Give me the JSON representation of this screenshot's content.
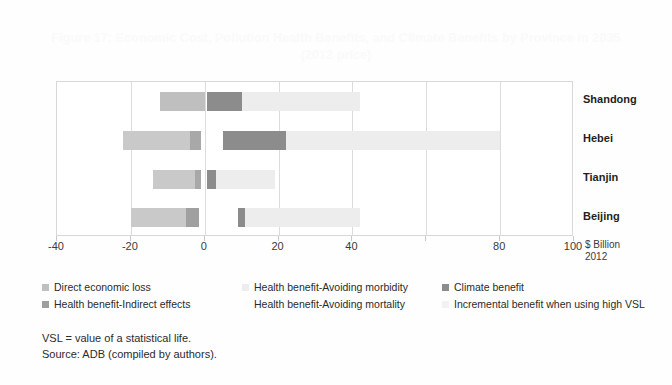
{
  "figure": {
    "title_line1": "Figure 17: Economic Cost, Pollution Health Benefits, and Climate Benefits by Province in 2035",
    "title_line2": "(2012 price)",
    "unit_line1": "$ Billion",
    "unit_line2": "2012"
  },
  "notes": {
    "line1": "VSL = value of a statistical life.",
    "line2": "Source: ADB (compiled by authors)."
  },
  "legend": [
    {
      "label": "Direct economic loss",
      "color": "#bfbfbf"
    },
    {
      "label": "Health benefit-Indirect effects",
      "color": "#9e9e9e"
    },
    {
      "label": "Health benefit-Avoiding morbidity",
      "color": "#ededed"
    },
    {
      "label": "Health benefit-Avoiding mortality",
      "color": "#fdfdfd"
    },
    {
      "label": "Climate benefit",
      "color": "#8c8c8c"
    },
    {
      "label": "Incremental benefit when using high VSL",
      "color": "#f2f2f2"
    }
  ],
  "chart_data": {
    "type": "bar",
    "orientation": "horizontal",
    "stacked": true,
    "title": "Figure 17: Economic Cost, Pollution Health Benefits, and Climate Benefits by Province in 2035 (2012 price)",
    "xlabel": "$ Billion 2012",
    "ylabel": "",
    "xlim": [
      -40,
      100
    ],
    "xticks": [
      -40,
      -20,
      0,
      20,
      40,
      60,
      80,
      100
    ],
    "xticklabels": [
      "-40",
      "-20",
      "0",
      "20",
      "40",
      "",
      "80",
      "100"
    ],
    "grid": true,
    "legend_position": "below",
    "categories": [
      "Shandong",
      "Hebei",
      "Tianjin",
      "Beijing"
    ],
    "series": [
      {
        "name": "Direct economic loss",
        "color": "#bfbfbf",
        "values": [
          -12.0,
          -20.0,
          -13.5,
          -18.0
        ]
      },
      {
        "name": "Health benefit-Indirect effects",
        "color": "#9e9e9e",
        "values": [
          0.0,
          -2.0,
          -1.5,
          -2.5
        ]
      },
      {
        "name": "Climate benefit",
        "color": "#8c8c8c",
        "values": [
          10.0,
          17.0,
          2.0,
          2.0
        ]
      },
      {
        "name": "Health benefit-Avoiding morbidity",
        "color": "#ededed",
        "values": [
          32.0,
          58.0,
          16.0,
          31.0
        ]
      }
    ],
    "bars": [
      {
        "category": "Shandong",
        "segments": [
          {
            "name": "Direct economic loss",
            "start": -12.0,
            "end": 0.0,
            "color": "#bfbfbf"
          },
          {
            "name": "Climate benefit",
            "start": 0.5,
            "end": 10.0,
            "color": "#8c8c8c"
          },
          {
            "name": "Health benefit-Avoiding morbidity",
            "start": 10.0,
            "end": 42.0,
            "color": "#ededed"
          }
        ]
      },
      {
        "category": "Hebei",
        "segments": [
          {
            "name": "Direct economic loss",
            "start": -22.0,
            "end": -4.0,
            "color": "#c9c9c9"
          },
          {
            "name": "Health benefit-Indirect effects",
            "start": -4.0,
            "end": -1.0,
            "color": "#a8a8a8"
          },
          {
            "name": "Climate benefit",
            "start": 5.0,
            "end": 22.0,
            "color": "#8c8c8c"
          },
          {
            "name": "Health benefit-Avoiding morbidity",
            "start": 22.0,
            "end": 80.0,
            "color": "#ededed"
          }
        ]
      },
      {
        "category": "Tianjin",
        "segments": [
          {
            "name": "Direct economic loss",
            "start": -14.0,
            "end": -2.5,
            "color": "#c9c9c9"
          },
          {
            "name": "Health benefit-Indirect effects",
            "start": -2.5,
            "end": -1.0,
            "color": "#a8a8a8"
          },
          {
            "name": "Climate benefit",
            "start": 0.5,
            "end": 3.0,
            "color": "#8c8c8c"
          },
          {
            "name": "Health benefit-Avoiding morbidity",
            "start": 3.0,
            "end": 19.0,
            "color": "#ededed"
          }
        ]
      },
      {
        "category": "Beijing",
        "segments": [
          {
            "name": "Direct economic loss",
            "start": -20.0,
            "end": -5.0,
            "color": "#c9c9c9"
          },
          {
            "name": "Health benefit-Indirect effects",
            "start": -5.0,
            "end": -1.5,
            "color": "#a0a0a0"
          },
          {
            "name": "Climate benefit",
            "start": 9.0,
            "end": 11.0,
            "color": "#8c8c8c"
          },
          {
            "name": "Health benefit-Avoiding morbidity",
            "start": 11.0,
            "end": 42.0,
            "color": "#ededed"
          }
        ]
      }
    ]
  }
}
